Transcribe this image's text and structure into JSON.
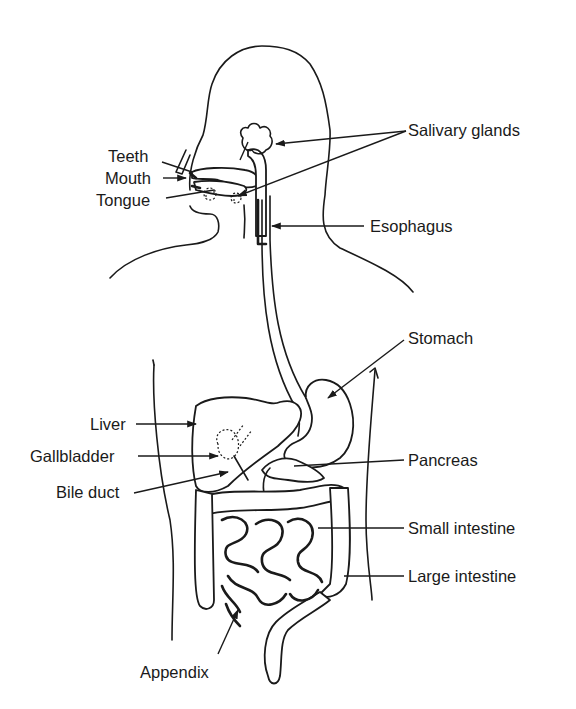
{
  "diagram": {
    "colors": {
      "ink": "#1a1a1a",
      "background": "#ffffff"
    },
    "labels": {
      "teeth": "Teeth",
      "mouth": "Mouth",
      "tongue": "Tongue",
      "salivary_glands": "Salivary glands",
      "esophagus": "Esophagus",
      "stomach": "Stomach",
      "liver": "Liver",
      "gallbladder": "Gallbladder",
      "bile_duct": "Bile duct",
      "pancreas": "Pancreas",
      "small_intestine": "Small intestine",
      "large_intestine": "Large intestine",
      "appendix": "Appendix"
    }
  }
}
